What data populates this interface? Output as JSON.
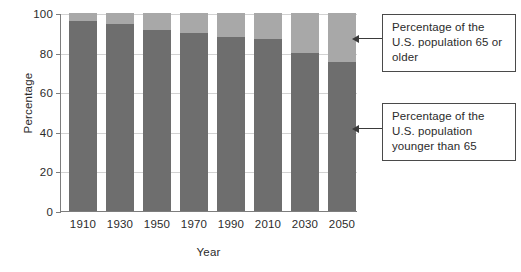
{
  "chart_data": {
    "type": "bar",
    "subtype": "stacked-bar",
    "title": "",
    "xlabel": "Year",
    "ylabel": "Percentage",
    "categories": [
      "1910",
      "1930",
      "1950",
      "1970",
      "1990",
      "2010",
      "2030",
      "2050"
    ],
    "ylim": [
      0,
      100
    ],
    "yticks": [
      0,
      20,
      40,
      60,
      80,
      100
    ],
    "ytick_labels": [
      "0",
      "20",
      "40",
      "60",
      "80",
      "100"
    ],
    "grid": true,
    "legend_position": "callouts-right",
    "series": [
      {
        "name": "Percentage of the U.S. population younger than 65",
        "color": "#6e6e6e",
        "values": [
          95.8,
          94.5,
          91.4,
          90.0,
          87.8,
          87.0,
          80.0,
          75.5
        ]
      },
      {
        "name": "Percentage of the U.S. population 65 or older",
        "color": "#a8a8a8",
        "values": [
          4.2,
          5.5,
          8.6,
          10.0,
          12.2,
          13.0,
          20.0,
          24.5
        ]
      }
    ],
    "annotations": [
      {
        "id": "upper",
        "text": "Percentage of the U.S. population 65 or older",
        "points_to": "upper-segment"
      },
      {
        "id": "lower",
        "text": "Percentage of the U.S. population younger than 65",
        "points_to": "lower-segment"
      }
    ]
  },
  "axes": {
    "y_title": "Percentage",
    "x_title": "Year"
  },
  "callouts": {
    "upper": "Percentage of the U.S. population 65 or older",
    "lower": "Percentage of the U.S. population younger than 65"
  },
  "colors": {
    "lower_segment": "#6e6e6e",
    "upper_segment": "#a8a8a8",
    "axis": "#7d7d7d",
    "grid": "#d2d2d2",
    "callout_border": "#4a4a4a",
    "text": "#2b2b2b"
  }
}
